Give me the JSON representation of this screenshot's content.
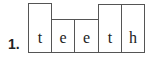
{
  "item": {
    "number_label": "1.",
    "word": "teeth",
    "boxes": [
      {
        "letter": "t",
        "shape": "tall"
      },
      {
        "letter": "e",
        "shape": "short"
      },
      {
        "letter": "e",
        "shape": "short"
      },
      {
        "letter": "t",
        "shape": "tall"
      },
      {
        "letter": "h",
        "shape": "tall"
      }
    ]
  }
}
